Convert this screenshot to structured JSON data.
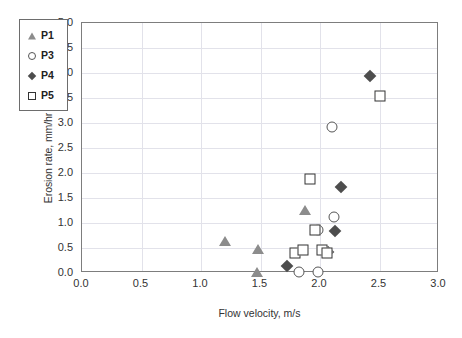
{
  "chart_data": {
    "type": "scatter",
    "title": "",
    "xlabel": "Flow velocity, m/s",
    "ylabel": "Erosion rate, mm/hr",
    "xlim": [
      0.0,
      3.0
    ],
    "ylim": [
      0.0,
      5.0
    ],
    "xticks": [
      "0.0",
      "0.5",
      "1.0",
      "1.5",
      "2.0",
      "2.5",
      "3.0"
    ],
    "yticks": [
      "0.0",
      "0.5",
      "1.0",
      "1.5",
      "2.0",
      "2.5",
      "3.0",
      "3.5",
      "4.0",
      "4.5",
      "5.0"
    ],
    "grid": true,
    "legend_position": "top-left",
    "series": [
      {
        "name": "P1",
        "marker": "triangle-filled",
        "color": "#8c8c8c",
        "points": [
          {
            "x": 1.2,
            "y": 0.65
          },
          {
            "x": 1.48,
            "y": 0.48
          },
          {
            "x": 1.47,
            "y": 0.03
          },
          {
            "x": 1.87,
            "y": 1.26
          }
        ]
      },
      {
        "name": "P3",
        "marker": "circle-open",
        "color": "#555555",
        "points": [
          {
            "x": 1.82,
            "y": 0.02
          },
          {
            "x": 1.98,
            "y": 0.02
          },
          {
            "x": 1.98,
            "y": 0.86
          },
          {
            "x": 2.12,
            "y": 1.12
          },
          {
            "x": 2.1,
            "y": 2.93
          }
        ]
      },
      {
        "name": "P4",
        "marker": "diamond-filled",
        "color": "#4d4d4d",
        "points": [
          {
            "x": 1.72,
            "y": 0.15
          },
          {
            "x": 2.07,
            "y": 0.42
          },
          {
            "x": 2.13,
            "y": 0.85
          },
          {
            "x": 2.18,
            "y": 1.72
          },
          {
            "x": 2.42,
            "y": 3.95
          }
        ]
      },
      {
        "name": "P5",
        "marker": "square-open",
        "color": "#333333",
        "points": [
          {
            "x": 1.79,
            "y": 0.4
          },
          {
            "x": 1.86,
            "y": 0.47
          },
          {
            "x": 1.96,
            "y": 0.86
          },
          {
            "x": 2.02,
            "y": 0.46
          },
          {
            "x": 2.06,
            "y": 0.41
          },
          {
            "x": 1.92,
            "y": 1.88
          },
          {
            "x": 2.5,
            "y": 3.55
          }
        ]
      }
    ]
  },
  "legend": {
    "items": [
      {
        "label": "P1",
        "marker": "triangle-filled"
      },
      {
        "label": "P3",
        "marker": "circle-open"
      },
      {
        "label": "P4",
        "marker": "diamond-filled"
      },
      {
        "label": "P5",
        "marker": "square-open"
      }
    ]
  }
}
